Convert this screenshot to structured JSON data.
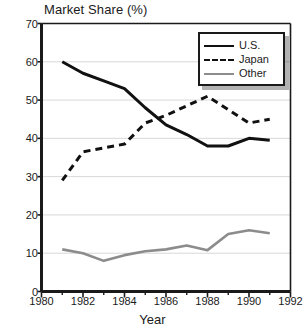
{
  "chart_data": {
    "type": "line",
    "title": "Market Share (%)",
    "xlabel": "Year",
    "ylabel": "",
    "xlim": [
      1980,
      1992
    ],
    "ylim": [
      0,
      70
    ],
    "grid": true,
    "grid_axis": "y",
    "legend_position": "top-right",
    "x": [
      1981,
      1982,
      1983,
      1984,
      1985,
      1986,
      1987,
      1988,
      1989,
      1990,
      1991
    ],
    "xticks": [
      1980,
      1982,
      1984,
      1986,
      1988,
      1990,
      1992
    ],
    "xtick_labels": [
      "1980",
      "1982",
      "1984",
      "1986",
      "1988",
      "1990",
      "1992"
    ],
    "xminor_ticks": [
      1981,
      1983,
      1985,
      1987,
      1989,
      1991
    ],
    "yticks": [
      0,
      10,
      20,
      30,
      40,
      50,
      60,
      70
    ],
    "ytick_labels": [
      "0",
      "10",
      "20",
      "30",
      "40",
      "50",
      "60",
      "70"
    ],
    "series": [
      {
        "name": "U.S.",
        "style": "solid",
        "color": "#111111",
        "values": [
          60.0,
          57.0,
          55.0,
          53.0,
          48.0,
          43.5,
          41.0,
          38.0,
          38.0,
          40.0,
          39.5
        ]
      },
      {
        "name": "Japan",
        "style": "dashed",
        "color": "#111111",
        "values": [
          29.0,
          36.5,
          37.5,
          38.5,
          44.0,
          46.0,
          48.5,
          51.0,
          47.5,
          44.0,
          45.0
        ]
      },
      {
        "name": "Other",
        "style": "solid",
        "color": "#8c8c8c",
        "values": [
          11.0,
          10.0,
          8.0,
          9.5,
          10.5,
          11.0,
          12.0,
          10.8,
          15.0,
          16.0,
          15.2
        ]
      }
    ]
  },
  "legend": {
    "entries": [
      {
        "label": "U.S."
      },
      {
        "label": "Japan"
      },
      {
        "label": "Other"
      }
    ]
  },
  "colors": {
    "axis": "#1a1a1a",
    "grid": "#d8d8d8",
    "us": "#111111",
    "japan": "#111111",
    "other": "#8c8c8c",
    "background": "#ffffff"
  }
}
